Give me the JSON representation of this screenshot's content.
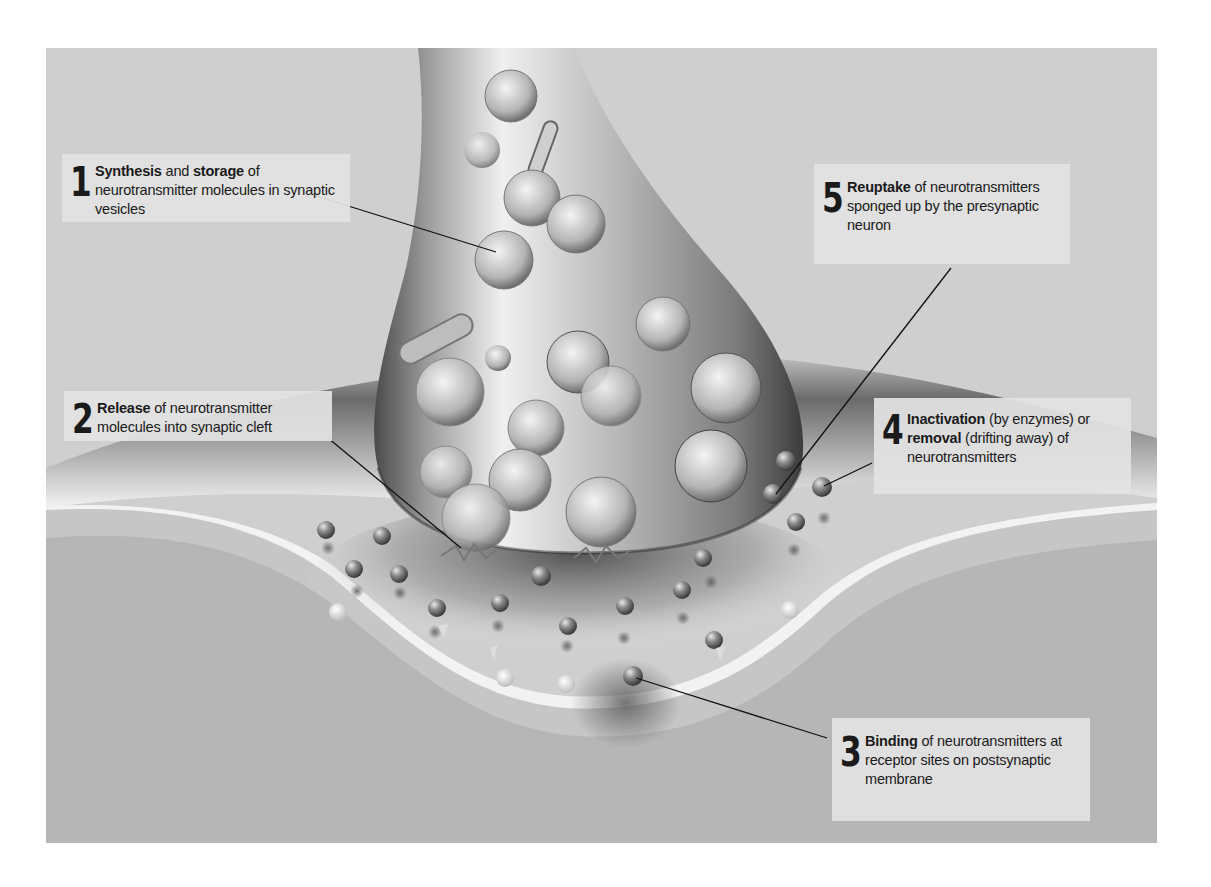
{
  "figure": {
    "colors": {
      "background": "#cfcfcf",
      "postsynaptic_cell": "#b8b8b8",
      "synaptic_cleft": "#f2f2f2",
      "label_box": "#e2e2e2",
      "leader_line": "#111111"
    }
  },
  "labels": [
    {
      "number": "1",
      "bold_a": "Synthesis",
      "text_a": " and ",
      "bold_b": "storage",
      "text_b": " of neurotransmitter molecules in synaptic vesicles"
    },
    {
      "number": "2",
      "bold_a": "Release",
      "text_a": " of neurotransmitter molecules into synaptic cleft",
      "bold_b": "",
      "text_b": ""
    },
    {
      "number": "3",
      "bold_a": "Binding",
      "text_a": " of neurotransmitters at receptor sites on postsynaptic membrane",
      "bold_b": "",
      "text_b": ""
    },
    {
      "number": "4",
      "bold_a": "Inactivation",
      "text_a": " (by enzymes) or ",
      "bold_b": "removal",
      "text_b": " (drifting away) of neurotransmitters"
    },
    {
      "number": "5",
      "bold_a": "Reuptake",
      "text_a": " of neurotransmitters sponged up by the presynaptic neuron",
      "bold_b": "",
      "text_b": ""
    }
  ]
}
